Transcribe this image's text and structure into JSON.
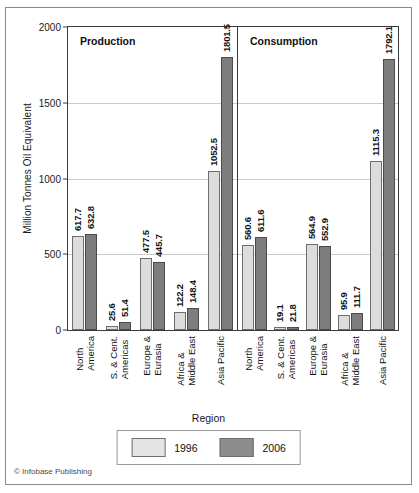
{
  "chart_data": {
    "type": "bar",
    "title": "",
    "xlabel": "Region",
    "ylabel": "Million Tonnes Oil Equivalent",
    "ylim": [
      0,
      2000
    ],
    "yticks": [
      0,
      500,
      1000,
      1500,
      2000
    ],
    "grid": true,
    "legend_position": "bottom-center",
    "panels": [
      {
        "name": "Production",
        "categories": [
          "North\nAmerica",
          "S. & Cent.\nAmericas",
          "Europe &\nEurasia",
          "Africa &\nMiddle East",
          "Asia Pacific"
        ],
        "series": [
          {
            "name": "1996",
            "values": [
              617.7,
              25.6,
              477.5,
              122.2,
              1052.5
            ]
          },
          {
            "name": "2006",
            "values": [
              632.8,
              51.4,
              445.7,
              148.4,
              1801.5
            ]
          }
        ]
      },
      {
        "name": "Consumption",
        "categories": [
          "North\nAmerica",
          "S. & Cent.\nAmericas",
          "Europe &\nEurasia",
          "Africa &\nMiddle East",
          "Asia Pacific"
        ],
        "series": [
          {
            "name": "1996",
            "values": [
              560.6,
              19.1,
              564.9,
              95.9,
              1115.3
            ]
          },
          {
            "name": "2006",
            "values": [
              611.6,
              21.8,
              552.9,
              111.7,
              1792.1
            ]
          }
        ]
      }
    ],
    "legend": [
      {
        "label": "1996",
        "color": "#e4e4e4"
      },
      {
        "label": "2006",
        "color": "#8d8d8d"
      }
    ]
  },
  "credit": "© Infobase Publishing"
}
